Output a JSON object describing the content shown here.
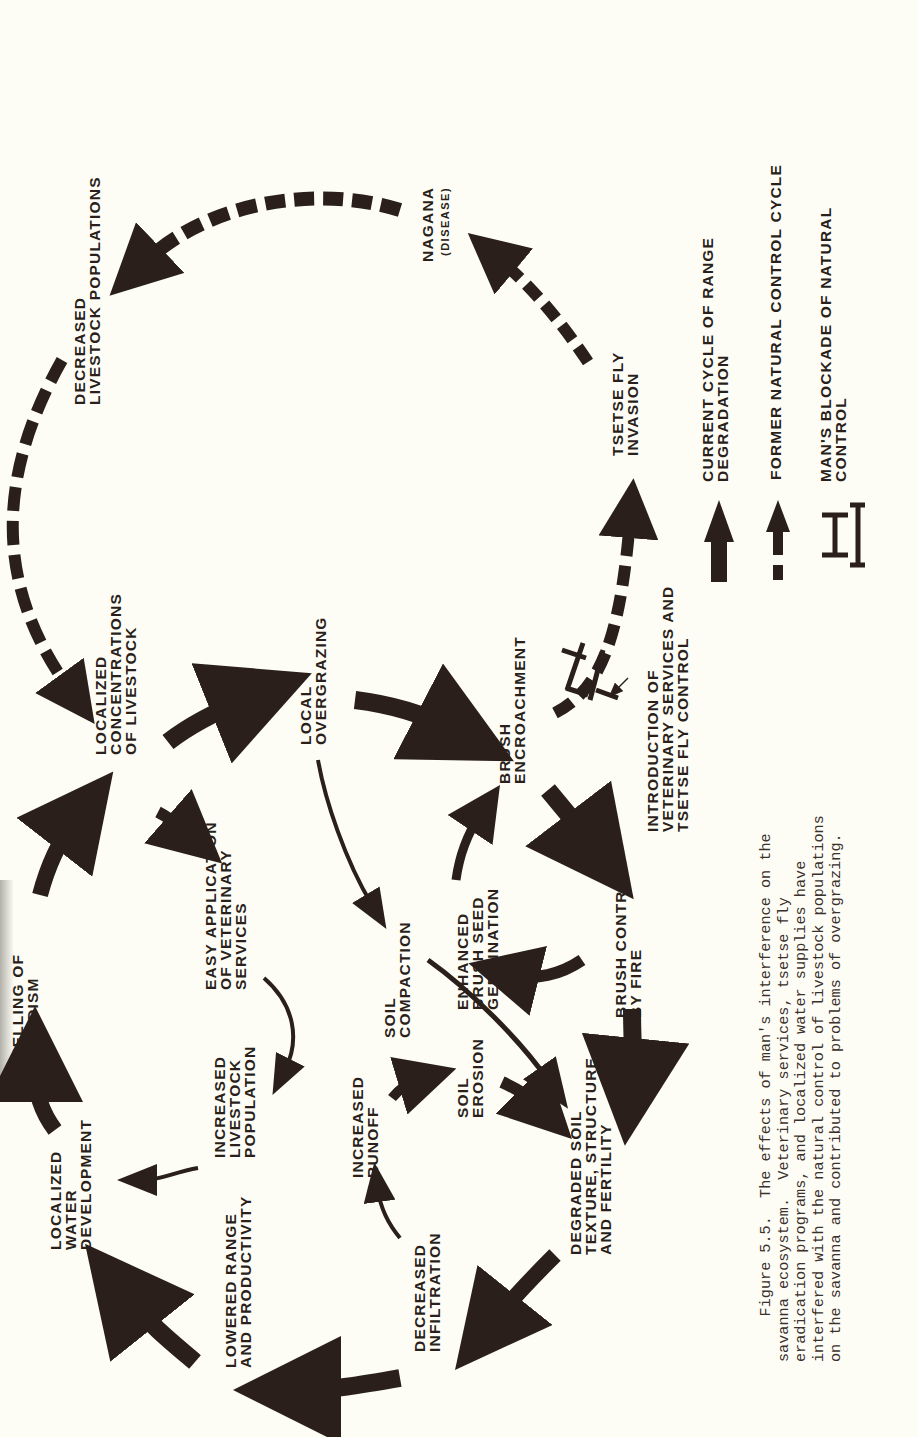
{
  "figure": {
    "orientation": "rotated-90-counterclockwise",
    "colors": {
      "ink": "#2a1f1b",
      "paper": "#fdfdf6"
    },
    "nodes": {
      "decreased_livestock_populations": "DECREASED\nLIVESTOCK POPULATIONS",
      "nagana": "NAGANA",
      "nagana_sub": "(DISEASE)",
      "tsetse_fly_invasion": "TSETSE FLY\nINVASION",
      "localized_concentrations": "LOCALIZED\nCONCENTRATIONS\nOF LIVESTOCK",
      "local_overgrazing": "LOCAL\nOVERGRAZING",
      "brush_encroachment": "BRUSH\nENCROACHMENT",
      "introduction_vet": "INTRODUCTION OF\nVETERINARY SERVICES AND\nTSETSE FLY CONTROL",
      "quelling_nomadism": "QUELLING OF\nNOMADISM",
      "easy_application": "EASY APPLICATION\nOF VETERINARY\nSERVICES",
      "soil_compaction": "SOIL\nCOMPACTION",
      "enhanced_brush_seed": "ENHANCED\nBRUSH SEED\nGERMINATION",
      "brush_control_fire": "BRUSH CONTROL\nBY FIRE",
      "localized_water": "LOCALIZED\nWATER\nDEVELOPMENT",
      "increased_livestock_population": "INCREASED\nLIVESTOCK\nPOPULATION",
      "increased_runoff": "INCREASED\nRUNOFF",
      "soil_erosion": "SOIL\nEROSION",
      "degraded_soil": "DEGRADED SOIL\nTEXTURE, STRUCTURE\nAND FERTILITY",
      "lowered_range": "LOWERED RANGE\nAND PRODUCTIVITY",
      "decreased_infiltration": "DECREASED\nINFILTRATION"
    },
    "edges": [
      {
        "from": "localized_water",
        "to": "quelling_nomadism",
        "type": "current"
      },
      {
        "from": "quelling_nomadism",
        "to": "localized_concentrations",
        "type": "current"
      },
      {
        "from": "localized_concentrations",
        "to": "local_overgrazing",
        "type": "current"
      },
      {
        "from": "localized_concentrations",
        "to": "easy_application",
        "type": "current"
      },
      {
        "from": "local_overgrazing",
        "to": "brush_encroachment",
        "type": "current"
      },
      {
        "from": "local_overgrazing",
        "to": "soil_compaction",
        "type": "current"
      },
      {
        "from": "brush_encroachment",
        "to": "brush_control_fire",
        "type": "current"
      },
      {
        "from": "brush_control_fire",
        "to": "enhanced_brush_seed",
        "type": "current"
      },
      {
        "from": "enhanced_brush_seed",
        "to": "brush_encroachment",
        "type": "current"
      },
      {
        "from": "brush_control_fire",
        "to": "degraded_soil",
        "type": "current"
      },
      {
        "from": "easy_application",
        "to": "increased_livestock_population",
        "type": "current"
      },
      {
        "from": "increased_livestock_population",
        "to": "localized_water",
        "type": "current"
      },
      {
        "from": "soil_compaction",
        "to": "degraded_soil",
        "type": "current"
      },
      {
        "from": "soil_erosion",
        "to": "degraded_soil",
        "type": "current"
      },
      {
        "from": "increased_runoff",
        "to": "soil_erosion",
        "type": "current"
      },
      {
        "from": "decreased_infiltration",
        "to": "increased_runoff",
        "type": "current"
      },
      {
        "from": "degraded_soil",
        "to": "decreased_infiltration",
        "type": "current"
      },
      {
        "from": "decreased_infiltration",
        "to": "lowered_range",
        "type": "current"
      },
      {
        "from": "lowered_range",
        "to": "localized_water",
        "type": "current"
      },
      {
        "from": "brush_encroachment",
        "to": "tsetse_fly_invasion",
        "type": "former",
        "blocked": true
      },
      {
        "from": "tsetse_fly_invasion",
        "to": "nagana",
        "type": "former"
      },
      {
        "from": "nagana",
        "to": "decreased_livestock_populations",
        "type": "former"
      },
      {
        "from": "decreased_livestock_populations",
        "to": "localized_concentrations",
        "type": "former"
      }
    ],
    "legend": {
      "current": "CURRENT CYCLE OF RANGE\nDEGRADATION",
      "former": "FORMER NATURAL CONTROL CYCLE",
      "blockade": "MAN'S BLOCKADE OF NATURAL\nCONTROL"
    },
    "caption": "     Figure 5.5.  The effects of man's interference on the\nsavanna ecosystem.  Veterinary services, tsetse fly\neradication programs, and localized water supplies have\ninterfered with the natural control of livestock populations\non the savanna and contributed to problems of overgrazing."
  }
}
